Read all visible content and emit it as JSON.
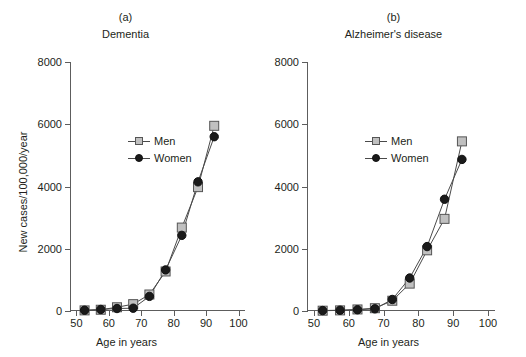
{
  "figure": {
    "background": "#ffffff",
    "ylabel": "New cases/100,000/year",
    "xlabel": "Age in years",
    "line_color": "#4a4a4a",
    "men_fill": "#c0c0c0",
    "men_stroke": "#555555",
    "women_fill": "#1a1a1a",
    "women_stroke": "#111111",
    "axis_color": "#5d5d5d",
    "text_color": "#231f20"
  },
  "panels": [
    {
      "letter": "(a)",
      "title": "Dementia",
      "xlabel": "Age in years",
      "legend": [
        {
          "label": "Men",
          "marker": "square"
        },
        {
          "label": "Women",
          "marker": "circle"
        }
      ]
    },
    {
      "letter": "(b)",
      "title": "Alzheimer's disease",
      "xlabel": "Age in years",
      "legend": [
        {
          "label": "Men",
          "marker": "square"
        },
        {
          "label": "Women",
          "marker": "circle"
        }
      ]
    }
  ],
  "chart_data": [
    {
      "type": "line",
      "panel": "(a)",
      "title": "Dementia",
      "xlabel": "Age in years",
      "ylabel": "New cases/100,000/year",
      "xlim": [
        48,
        102
      ],
      "ylim": [
        0,
        8000
      ],
      "xticks": [
        50,
        60,
        70,
        80,
        90,
        100
      ],
      "xticklabels": [
        "50",
        "60",
        "70",
        "80",
        "90",
        "100"
      ],
      "yticks": [
        0,
        2000,
        4000,
        6000,
        8000
      ],
      "yticklabels": [
        "0",
        "2000",
        "4000",
        "6000",
        "8000"
      ],
      "grid": false,
      "legend_position": "upper-left-inside",
      "x": [
        52.5,
        57.5,
        62.5,
        67.5,
        72.5,
        77.5,
        82.5,
        87.5,
        92.5
      ],
      "series": [
        {
          "name": "Men",
          "marker": "square",
          "values": [
            20,
            40,
            120,
            220,
            530,
            1270,
            2680,
            3980,
            5950
          ]
        },
        {
          "name": "Women",
          "marker": "circle",
          "values": [
            25,
            50,
            80,
            90,
            470,
            1320,
            2430,
            4150,
            5600
          ]
        }
      ]
    },
    {
      "type": "line",
      "panel": "(b)",
      "title": "Alzheimer's disease",
      "xlabel": "Age in years",
      "ylabel": "New cases/100,000/year",
      "xlim": [
        48,
        102
      ],
      "ylim": [
        0,
        8000
      ],
      "xticks": [
        50,
        60,
        70,
        80,
        90,
        100
      ],
      "xticklabels": [
        "50",
        "60",
        "70",
        "80",
        "90",
        "100"
      ],
      "yticks": [
        0,
        2000,
        4000,
        6000,
        8000
      ],
      "yticklabels": [
        "0",
        "2000",
        "4000",
        "6000",
        "8000"
      ],
      "grid": false,
      "legend_position": "upper-left-inside",
      "x": [
        52.5,
        57.5,
        62.5,
        67.5,
        72.5,
        77.5,
        82.5,
        87.5,
        92.5
      ],
      "series": [
        {
          "name": "Men",
          "marker": "square",
          "values": [
            10,
            20,
            50,
            90,
            330,
            880,
            1950,
            2960,
            5450
          ]
        },
        {
          "name": "Women",
          "marker": "circle",
          "values": [
            15,
            25,
            40,
            70,
            370,
            1060,
            2070,
            3590,
            4870
          ]
        }
      ]
    }
  ]
}
